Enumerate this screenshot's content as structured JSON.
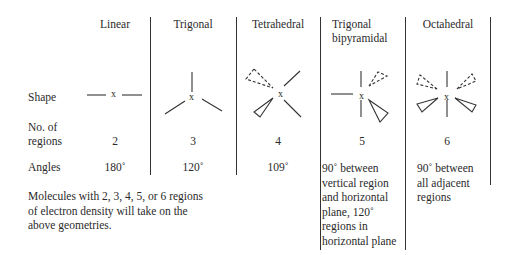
{
  "row_labels": {
    "shape": "Shape",
    "regions_line1": "No. of",
    "regions_line2": "regions",
    "angles": "Angles"
  },
  "center_atom": "x",
  "columns": [
    {
      "name": "Linear",
      "name_line2": "",
      "regions": "2",
      "angles": [
        "180˚"
      ]
    },
    {
      "name": "Trigonal",
      "name_line2": "",
      "regions": "3",
      "angles": [
        "120˚"
      ]
    },
    {
      "name": "Tetrahedral",
      "name_line2": "",
      "regions": "4",
      "angles": [
        "109˚"
      ]
    },
    {
      "name": "Trigonal",
      "name_line2": "bipyramidal",
      "regions": "5",
      "angles": [
        "90˚ between",
        "vertical region",
        "and horizontal",
        "plane, 120˚",
        "regions in",
        "horizontal plane"
      ]
    },
    {
      "name": "Octahedral",
      "name_line2": "",
      "regions": "6",
      "angles": [
        "90˚ between",
        "all adjacent",
        "regions"
      ]
    }
  ],
  "footnote": [
    "Molecules with 2, 3, 4, 5, or 6 regions",
    "of electron density will take on the",
    "above geometries."
  ]
}
